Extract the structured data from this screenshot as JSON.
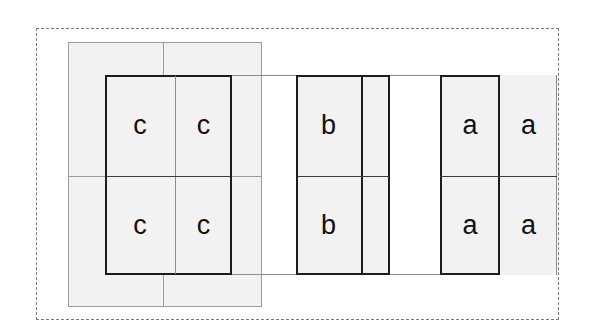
{
  "figure": {
    "width": 597,
    "height": 335,
    "background_color": "#ffffff",
    "fill_color": "#f2f2f2",
    "thick_stroke_color": "#1d1d1d",
    "thin_stroke_color": "#9a9a9a",
    "dashed_border_color": "#7a7a7a",
    "label_color": "#111111"
  },
  "dashed_frame": {
    "name": "outer-boundary",
    "x": 36,
    "y": 28,
    "width": 523,
    "height": 292,
    "style": "dashed"
  },
  "background_block": {
    "name": "background-block",
    "x": 68,
    "y": 42,
    "width": 194,
    "height": 265,
    "divider_x": 163
  },
  "groups": [
    {
      "id": "group-c",
      "x": 105,
      "y": 75,
      "width": 127,
      "height": 200,
      "columns": [
        {
          "x": 105,
          "width": 70
        },
        {
          "x": 175,
          "width": 57
        }
      ],
      "inner_divider_x": 175,
      "mid_y": 176,
      "cells": [
        {
          "row": 0,
          "col": 0,
          "label": "c"
        },
        {
          "row": 0,
          "col": 1,
          "label": "c"
        },
        {
          "row": 1,
          "col": 0,
          "label": "c"
        },
        {
          "row": 1,
          "col": 1,
          "label": "c"
        }
      ]
    },
    {
      "id": "group-b",
      "x": 296,
      "y": 75,
      "width": 94,
      "height": 200,
      "columns": [
        {
          "x": 296,
          "width": 67
        },
        {
          "x": 363,
          "width": 27
        }
      ],
      "inner_divider_x": 363,
      "mid_y": 176,
      "cells": [
        {
          "row": 0,
          "col": 0,
          "label": "b"
        },
        {
          "row": 0,
          "col": 1,
          "label": ""
        },
        {
          "row": 1,
          "col": 0,
          "label": "b"
        },
        {
          "row": 1,
          "col": 1,
          "label": ""
        }
      ]
    },
    {
      "id": "group-a",
      "x": 440,
      "y": 75,
      "width": 117,
      "height": 200,
      "columns": [
        {
          "x": 440,
          "width": 60
        },
        {
          "x": 500,
          "width": 57
        }
      ],
      "inner_divider_x": 500,
      "mid_y": 176,
      "cells": [
        {
          "row": 0,
          "col": 0,
          "label": "a"
        },
        {
          "row": 0,
          "col": 1,
          "label": "a"
        },
        {
          "row": 1,
          "col": 0,
          "label": "a"
        },
        {
          "row": 1,
          "col": 1,
          "label": "a"
        }
      ]
    }
  ],
  "labels": {
    "c_top_left": "c",
    "c_top_right": "c",
    "c_bottom_left": "c",
    "c_bottom_right": "c",
    "b_top": "b",
    "b_bottom": "b",
    "a_top_left": "a",
    "a_top_right": "a",
    "a_bottom_left": "a",
    "a_bottom_right": "a"
  }
}
